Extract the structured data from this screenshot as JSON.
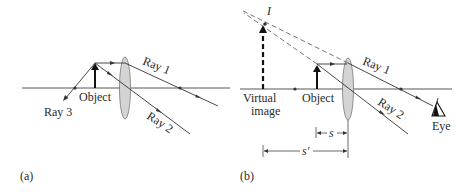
{
  "figure": {
    "panels": [
      {
        "id": "a",
        "caption": "(a)",
        "labels": {
          "object": "Object",
          "ray1": "Ray 1",
          "ray2": "Ray 2",
          "ray3": "Ray 3"
        }
      },
      {
        "id": "b",
        "caption": "(b)",
        "labels": {
          "image_point": "I",
          "virtual_image_line1": "Virtual",
          "virtual_image_line2": "image",
          "object": "Object",
          "ray1": "Ray 1",
          "ray2": "Ray 2",
          "eye": "Eye",
          "object_distance": "s",
          "image_distance": "s′"
        }
      }
    ],
    "colors": {
      "line": "#333333",
      "lens_fill": "#d4d4d4",
      "lens_stroke": "#777777",
      "background": "#ffffff"
    }
  }
}
